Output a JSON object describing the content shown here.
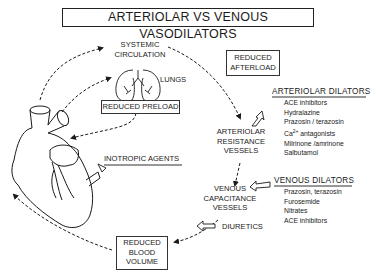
{
  "title": "ARTERIOLAR VS VENOUS VASODILATORS",
  "nodes": {
    "systemic_circulation": [
      "SYSTEMIC",
      "CIRCULATION"
    ],
    "lungs": "LUNGS",
    "reduced_preload": "REDUCED PRELOAD",
    "reduced_afterload": [
      "REDUCED",
      "AFTERLOAD"
    ],
    "inotropic_agents": "INOTROPIC AGENTS",
    "arteriolar_resistance_vessels": [
      "ARTERIOLAR",
      "RESISTANCE",
      "VESSELS"
    ],
    "venous_capacitance_vessels": [
      "VENOUS",
      "CAPACITANCE",
      "VESSELS"
    ],
    "diuretics": "DIURETICS",
    "reduced_blood_volume": [
      "REDUCED",
      "BLOOD",
      "VOLUME"
    ]
  },
  "arteriolar_dilators": {
    "heading": "ARTERIOLAR DILATORS",
    "items": [
      "ACE inhibitors",
      "Hydralazine",
      "Prazosin / terazosin",
      "antagonists",
      "Milrinone /amrinone",
      "Salbutamol"
    ],
    "ca_prefix": "Ca",
    "ca_superscript": "2+"
  },
  "venous_dilators": {
    "heading": "VENOUS DILATORS",
    "items": [
      "Prazosin, terazosin",
      "Furosemide",
      "Nitrates",
      "ACE inhibitors"
    ]
  },
  "icons": {
    "heart": "heart-illustration",
    "lungs": "lungs-illustration",
    "hollow_arrow": "hollow-arrow-icon"
  },
  "colors": {
    "ink": "#1a1a1a",
    "background": "#ffffff"
  }
}
